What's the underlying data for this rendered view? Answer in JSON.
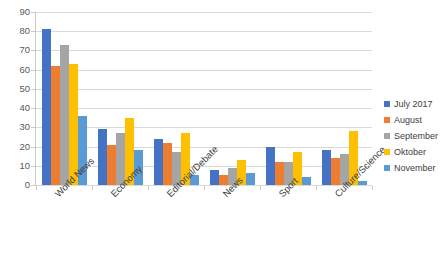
{
  "chart_data": {
    "type": "bar",
    "title": "",
    "subtitle": "",
    "xlabel": "",
    "ylabel": "",
    "ylim": [
      0,
      90
    ],
    "ytick_step": 10,
    "yticks": [
      90,
      80,
      70,
      60,
      50,
      40,
      30,
      20,
      10,
      0
    ],
    "grid": true,
    "legend_position": "right",
    "categories": [
      "World News",
      "Economy",
      "Editorial/Debate",
      "News",
      "Sport",
      "Culture/Science"
    ],
    "series": [
      {
        "name": "July 2017",
        "color": "#4472C4",
        "values": [
          81,
          29,
          24,
          8,
          20,
          18
        ]
      },
      {
        "name": "August",
        "color": "#ED7D31",
        "values": [
          62,
          21,
          22,
          5,
          12,
          14
        ]
      },
      {
        "name": "September",
        "color": "#A5A5A5",
        "values": [
          73,
          27,
          17,
          9,
          12,
          16
        ]
      },
      {
        "name": "Oktober",
        "color": "#FFC000",
        "values": [
          63,
          35,
          27,
          13,
          17,
          28
        ]
      },
      {
        "name": "November",
        "color": "#5B9BD5",
        "values": [
          36,
          18,
          5,
          6,
          4,
          2
        ]
      }
    ]
  },
  "colors": {
    "gridline": "#d9d9d9",
    "axis": "#c8c8c8",
    "text": "#404040",
    "background": "#ffffff"
  }
}
